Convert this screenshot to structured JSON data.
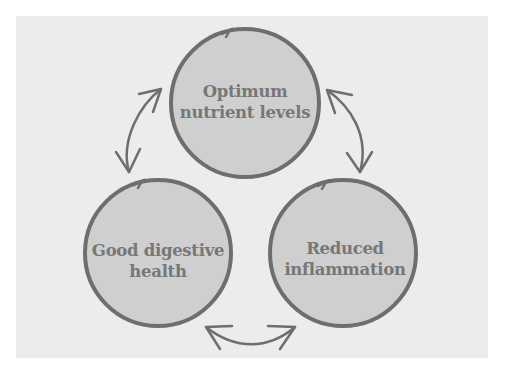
{
  "colors": {
    "background": "#ffffff",
    "panel": "#ececec",
    "circle_fill": "#cfcfcf",
    "circle_stroke": "#6e6e6e",
    "arrow_stroke": "#6e6e6e",
    "text": "#777777"
  },
  "nodes": [
    {
      "id": "optimum-nutrient-levels",
      "lines": [
        "Optimum",
        "nutrient levels"
      ]
    },
    {
      "id": "good-digestive-health",
      "lines": [
        "Good digestive",
        "health"
      ]
    },
    {
      "id": "reduced-inflammation",
      "lines": [
        "Reduced",
        "inflammation"
      ]
    }
  ],
  "connections": [
    {
      "from": "optimum-nutrient-levels",
      "to": "good-digestive-health",
      "type": "bidirectional-arrow"
    },
    {
      "from": "optimum-nutrient-levels",
      "to": "reduced-inflammation",
      "type": "bidirectional-arrow"
    },
    {
      "from": "good-digestive-health",
      "to": "reduced-inflammation",
      "type": "bidirectional-arrow"
    }
  ]
}
